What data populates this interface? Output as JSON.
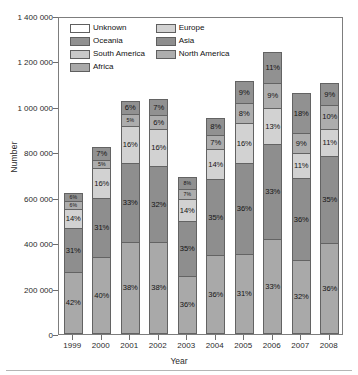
{
  "chart_data": {
    "type": "bar",
    "subtype": "stacked-percentage",
    "title": "",
    "xlabel": "Year",
    "ylabel": "Number",
    "ylim": [
      0,
      1400000
    ],
    "ytick_values": [
      0,
      200000,
      400000,
      600000,
      800000,
      1000000,
      1200000,
      1400000
    ],
    "ytick_labels": [
      "0",
      "200 000",
      "400 000",
      "600 000",
      "800 000",
      "1 000 000",
      "1 200 000",
      "1 400 000"
    ],
    "grid": false,
    "legend_position": "upper-left-inside",
    "categories": [
      "1999",
      "2000",
      "2001",
      "2002",
      "2003",
      "2004",
      "2005",
      "2006",
      "2007",
      "2008"
    ],
    "totals": [
      645000,
      848000,
      1065000,
      1062000,
      708000,
      968000,
      1130000,
      1272000,
      1058000,
      1112000
    ],
    "stack_order_bottom_to_top": [
      "Africa",
      "Asia",
      "Europe",
      "North America",
      "Oceania"
    ],
    "series": [
      {
        "name": "Africa",
        "color": "#a9a9a9",
        "unit": "%",
        "values": [
          42,
          40,
          38,
          38,
          36,
          36,
          31,
          33,
          32,
          36
        ],
        "labels": [
          "42%",
          "40%",
          "38%",
          "38%",
          "36%",
          "36%",
          "31%",
          "33%",
          "32%",
          "36%"
        ]
      },
      {
        "name": "Asia",
        "color": "#8e8e8e",
        "unit": "%",
        "values": [
          31,
          31,
          33,
          32,
          35,
          35,
          36,
          33,
          36,
          35
        ],
        "labels": [
          "31%",
          "31%",
          "33%",
          "32%",
          "35%",
          "35%",
          "36%",
          "33%",
          "36%",
          "35%"
        ]
      },
      {
        "name": "Europe",
        "color": "#d2d2d2",
        "unit": "%",
        "values": [
          14,
          16,
          16,
          16,
          14,
          14,
          16,
          13,
          11,
          11
        ],
        "labels": [
          "14%",
          "16%",
          "16%",
          "16%",
          "14%",
          "14%",
          "16%",
          "13%",
          "11%",
          "11%"
        ]
      },
      {
        "name": "North America",
        "color": "#adadad",
        "unit": "%",
        "values": [
          6,
          5,
          5,
          6,
          7,
          7,
          8,
          9,
          9,
          10
        ],
        "labels": [
          "6%",
          "5%",
          "5%",
          "6%",
          "7%",
          "7%",
          "8%",
          "9%",
          "9%",
          "10%"
        ]
      },
      {
        "name": "Oceania",
        "color": "#919191",
        "unit": "%",
        "values": [
          6,
          7,
          6,
          7,
          8,
          8,
          9,
          11,
          18,
          9
        ],
        "labels": [
          "6%",
          "7%",
          "6%",
          "7%",
          "8%",
          "8%",
          "9%",
          "11%",
          "18%",
          "9%"
        ]
      }
    ],
    "legend_entries": [
      {
        "label": "Unknown",
        "color": "#ffffff"
      },
      {
        "label": "Europe",
        "color": "#d2d2d2"
      },
      {
        "label": "Oceania",
        "color": "#919191"
      },
      {
        "label": "Asia",
        "color": "#8e8e8e"
      },
      {
        "label": "South America",
        "color": "#c9c9c9"
      },
      {
        "label": "North America",
        "color": "#adadad"
      },
      {
        "label": "Africa",
        "color": "#a9a9a9"
      }
    ]
  }
}
